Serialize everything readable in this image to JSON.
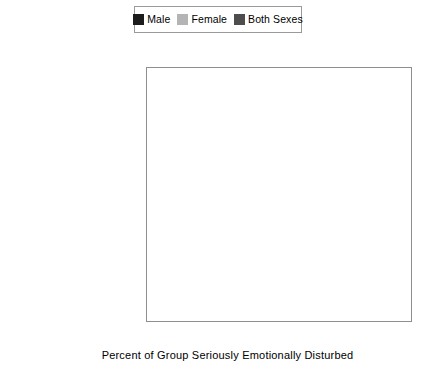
{
  "legend": {
    "position": "top-center",
    "entries": [
      {
        "label": "Male",
        "color": "#1c1c1c",
        "swatch_name": "legend-swatch-male"
      },
      {
        "label": "Female",
        "color": "#b4b4b4",
        "swatch_name": "legend-swatch-female"
      },
      {
        "label": "Both Sexes",
        "color": "#4d4d4d",
        "swatch_name": "legend-swatch-both-sexes"
      }
    ]
  },
  "axis": {
    "x_title": "Percent of Group Seriously Emotionally Disturbed",
    "x_ticks": [
      "0",
      "0.5",
      "1",
      "1.5",
      "2"
    ],
    "x_min": 0,
    "x_max": 2
  },
  "categories": [
    "AMERICAN INDIAN",
    "ASIAN/PACIFIC ISLANDER",
    "HISPANIC",
    "BLACK",
    "WHITE"
  ],
  "chart_data": {
    "type": "bar",
    "orientation": "horizontal",
    "title": "",
    "subtitle": "",
    "xlabel": "Percent of Group Seriously Emotionally Disturbed",
    "ylabel": "",
    "xlim": [
      0,
      2
    ],
    "xticks": [
      0,
      0.5,
      1,
      1.5,
      2
    ],
    "grid": false,
    "legend_position": "top-center",
    "categories": [
      "AMERICAN INDIAN",
      "ASIAN/PACIFIC ISLANDER",
      "HISPANIC",
      "BLACK",
      "WHITE"
    ],
    "series": [
      {
        "name": "Male",
        "color": "#1c1c1c",
        "values": [
          1.45,
          0.28,
          0.74,
          1.75,
          1.19
        ]
      },
      {
        "name": "Female",
        "color": "#b4b4b4",
        "values": [
          0.45,
          0.06,
          0.2,
          0.48,
          0.34
        ]
      },
      {
        "name": "Both Sexes",
        "color": "#4d4d4d",
        "values": [
          0.95,
          0.19,
          0.48,
          1.12,
          0.77
        ]
      }
    ]
  }
}
